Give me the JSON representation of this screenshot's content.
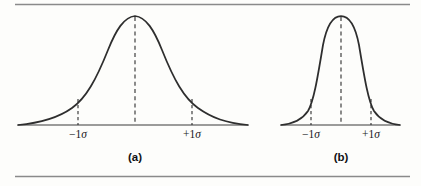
{
  "figure": {
    "background_color": "#fdfdfb",
    "ink_color": "#2e2e2e",
    "rule_color": "#8a8a8a",
    "width": 421,
    "height": 186
  },
  "rules": {
    "top_rule_label": "top-horizontal-rule",
    "bottom_rule_label": "bottom-horizontal-rule"
  },
  "panels": [
    {
      "id": "a",
      "caption": "(a)",
      "caption_x": 135,
      "caption_y": 152,
      "baseline_y": 125,
      "baseline_x_start": 18,
      "baseline_x_end": 248,
      "center_x": 135,
      "peak_y": 16,
      "sigma_px": 57,
      "shape": "broad-flat-bell",
      "ticks": [
        {
          "label_minus": "−1",
          "label_sigma": "σ",
          "text": "−1σ",
          "x": 78,
          "curve_y": 99
        },
        {
          "label_minus": "+1",
          "label_sigma": "σ",
          "text": "+1σ",
          "x": 192,
          "curve_y": 99
        }
      ],
      "tick_label_y": 128
    },
    {
      "id": "b",
      "caption": "(b)",
      "caption_x": 341,
      "caption_y": 152,
      "baseline_y": 125,
      "baseline_x_start": 281,
      "baseline_x_end": 400,
      "center_x": 341,
      "peak_y": 16,
      "sigma_px": 30,
      "shape": "narrow-peaked-bell",
      "ticks": [
        {
          "label_minus": "−1",
          "label_sigma": "σ",
          "text": "−1σ",
          "x": 311,
          "curve_y": 99
        },
        {
          "label_minus": "+1",
          "label_sigma": "σ",
          "text": "+1σ",
          "x": 371,
          "curve_y": 99
        }
      ],
      "tick_label_y": 128
    }
  ],
  "chart_data": {
    "type": "line",
    "title": "",
    "subtitle": "",
    "xlabel": "",
    "ylabel": "",
    "grid": false,
    "legend_position": "none",
    "annotations": [
      "−1σ",
      "+1σ",
      "(a)",
      "(b)"
    ],
    "series": [
      {
        "name": "(a) broad normal distribution",
        "description": "Wide, low-kurtosis bell curve; large standard deviation",
        "mean": 0,
        "sigma": 1,
        "relative_sigma_width_px": 57,
        "peak_height_px": 109,
        "x_sigma_units": [
          -2.05,
          -1.75,
          -1.5,
          -1.25,
          -1.0,
          -0.75,
          -0.5,
          -0.25,
          0,
          0.25,
          0.5,
          0.75,
          1.0,
          1.25,
          1.5,
          1.75,
          2.05
        ],
        "y_normalized": [
          0.0,
          0.12,
          0.22,
          0.37,
          0.54,
          0.72,
          0.88,
          0.97,
          1.0,
          0.97,
          0.88,
          0.72,
          0.54,
          0.37,
          0.22,
          0.12,
          0.0
        ]
      },
      {
        "name": "(b) narrow normal distribution",
        "description": "Narrow, high-kurtosis bell curve; small standard deviation",
        "mean": 0,
        "sigma": 1,
        "relative_sigma_width_px": 30,
        "peak_height_px": 109,
        "x_sigma_units": [
          -2.05,
          -1.75,
          -1.5,
          -1.25,
          -1.0,
          -0.75,
          -0.5,
          -0.25,
          0,
          0.25,
          0.5,
          0.75,
          1.0,
          1.25,
          1.5,
          1.75,
          2.05
        ],
        "y_normalized": [
          0.0,
          0.1,
          0.2,
          0.35,
          0.53,
          0.73,
          0.9,
          0.99,
          1.0,
          0.99,
          0.9,
          0.73,
          0.53,
          0.35,
          0.2,
          0.1,
          0.0
        ]
      }
    ]
  }
}
